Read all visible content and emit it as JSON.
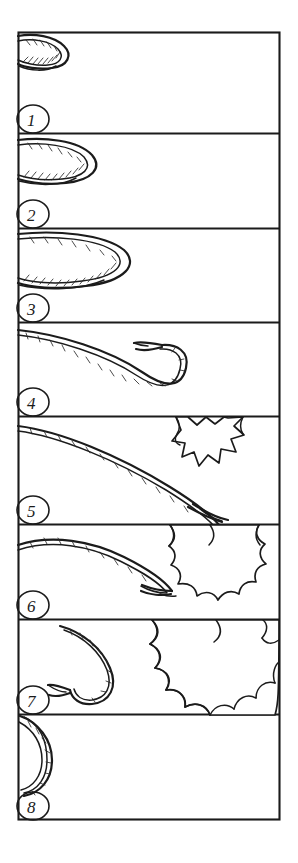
{
  "artwork": {
    "title": "Whip Crack Animation Sequence",
    "medium": "hand-drawn ink storyboard",
    "panel_count": 8,
    "background_color": "#ffffff",
    "ink_color": "#1a1a1a",
    "frame": {
      "x": 18,
      "y": 32,
      "width": 262,
      "height": 788
    }
  },
  "panels": [
    {
      "number": "1",
      "label_name": "panel-number-1",
      "top": 32,
      "height": 101,
      "description": "Whip coiled back at upper left, braided loop entering from frame edge",
      "elements": [
        "whip-coil",
        "panel-number-1"
      ]
    },
    {
      "number": "2",
      "label_name": "panel-number-2",
      "top": 133,
      "height": 95,
      "description": "Whip loop unfurling, arc reaching toward center of panel",
      "elements": [
        "whip-arc",
        "panel-number-2"
      ]
    },
    {
      "number": "3",
      "label_name": "panel-number-3",
      "top": 228,
      "height": 94,
      "description": "Whip loop extended further right, long flattened U curve",
      "elements": [
        "whip-arc",
        "panel-number-3"
      ]
    },
    {
      "number": "4",
      "label_name": "panel-number-4",
      "top": 322,
      "height": 94,
      "description": "Whip loop fully extended with forked cracker tip flicking up",
      "elements": [
        "whip-arc",
        "whip-cracker-tip",
        "panel-number-4"
      ]
    },
    {
      "number": "5",
      "label_name": "panel-number-5",
      "top": 416,
      "height": 108,
      "description": "Whip snaps taut diagonally downward; small spiky impact burst appears at right",
      "elements": [
        "whip-line",
        "whip-cracker-tip",
        "impact-burst-small",
        "panel-number-5"
      ]
    },
    {
      "number": "6",
      "label_name": "panel-number-6",
      "top": 524,
      "height": 95,
      "description": "Whip tip curls back; medium scalloped impact burst grows at lower right",
      "elements": [
        "whip-line",
        "whip-cracker-tip",
        "impact-burst-medium",
        "panel-number-6"
      ]
    },
    {
      "number": "7",
      "label_name": "panel-number-7",
      "top": 619,
      "height": 95,
      "description": "Whip recoils into a hook at left; large scalloped dust cloud fills the right half",
      "elements": [
        "whip-hook",
        "impact-burst-large",
        "panel-number-7"
      ]
    },
    {
      "number": "8",
      "label_name": "panel-number-8",
      "top": 714,
      "height": 106,
      "description": "Whip returned to a small coil at far left; burst has dissipated, panel otherwise empty",
      "elements": [
        "whip-coil",
        "panel-number-8"
      ]
    }
  ]
}
